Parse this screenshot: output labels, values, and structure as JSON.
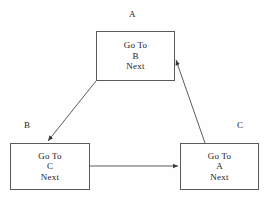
{
  "diagram": {
    "type": "state-transition-cycle",
    "background_color": "#fefefe",
    "line_color": "#4a4a4a",
    "text_color": "#1a1a1a",
    "nodes": [
      {
        "id": "A",
        "tag": "A",
        "lines": [
          "Go To",
          "B",
          "Next"
        ],
        "line1": "Go To",
        "line2": "B",
        "line3": "Next"
      },
      {
        "id": "B",
        "tag": "B",
        "lines": [
          "Go To",
          "C",
          "Next"
        ],
        "line1": "Go To",
        "line2": "C",
        "line3": "Next"
      },
      {
        "id": "C",
        "tag": "C",
        "lines": [
          "Go To",
          "A",
          "Next"
        ],
        "line1": "Go To",
        "line2": "A",
        "line3": "Next"
      }
    ],
    "edges": [
      {
        "id": "a-to-b",
        "from": "A",
        "to": "B",
        "style": "diagonal-arrow"
      },
      {
        "id": "b-to-c",
        "from": "B",
        "to": "C",
        "style": "horizontal-arrow"
      },
      {
        "id": "c-to-a",
        "from": "C",
        "to": "A",
        "style": "diagonal-arrow"
      }
    ]
  }
}
